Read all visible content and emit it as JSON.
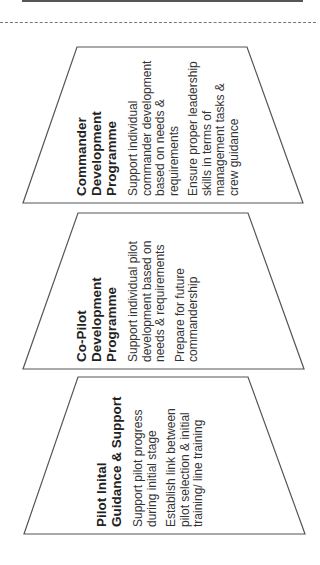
{
  "stages": [
    {
      "title_lines": [
        "Commander",
        "Development",
        "Programme"
      ],
      "bullets": [
        [
          "Support individual",
          "commander development",
          "based on needs &",
          "requirements"
        ],
        [
          "Ensure proper leadership",
          "skills in terms of",
          "management tasks &",
          "crew guidance"
        ]
      ]
    },
    {
      "title_lines": [
        "Co-Pilot",
        "Development",
        "Programme"
      ],
      "bullets": [
        [
          "Support individual pilot",
          "development based on",
          "needs & requirements"
        ],
        [
          "Prepare for future",
          "commandership"
        ]
      ]
    },
    {
      "title_lines": [
        "Pilot Inital",
        "Guidance & Support"
      ],
      "bullets": [
        [
          "Support pilot progress",
          "during initial stage"
        ],
        [
          "Establish link between",
          "pilot selection & initial",
          "training/ line training"
        ]
      ]
    }
  ],
  "colors": {
    "stroke": "#555555",
    "text": "#222222"
  }
}
